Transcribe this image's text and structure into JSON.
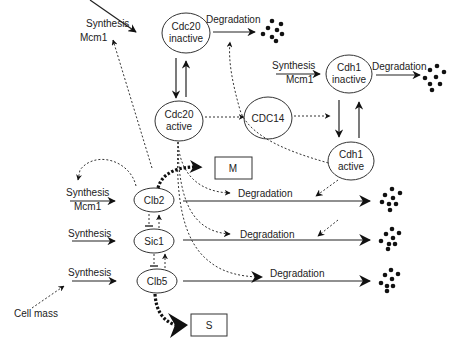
{
  "diagram": {
    "nodes": {
      "cdc20_inactive": {
        "line1": "Cdc20",
        "line2": "inactive"
      },
      "cdc20_active": {
        "line1": "Cdc20",
        "line2": "active"
      },
      "cdc14": {
        "label": "CDC14"
      },
      "cdh1_inactive": {
        "line1": "Cdh1",
        "line2": "inactive"
      },
      "cdh1_active": {
        "line1": "Cdh1",
        "line2": "active"
      },
      "clb2": {
        "label": "Clb2"
      },
      "sic1": {
        "label": "Sic1"
      },
      "clb5": {
        "label": "Clb5"
      },
      "m_phase": {
        "label": "M"
      },
      "s_phase": {
        "label": "S"
      }
    },
    "labels": {
      "synthesis": "Synthesis",
      "degradation": "Degradation",
      "mcm1": "Mcm1",
      "cell_mass": "Cell mass"
    },
    "edges": [
      {
        "from": "Synthesis (Mcm1)",
        "to": "Cdc20 inactive",
        "type": "solid"
      },
      {
        "from": "Cdc20 inactive",
        "to": "Degradation",
        "type": "solid"
      },
      {
        "from": "Cdc20 inactive",
        "to": "Cdc20 active",
        "type": "solid"
      },
      {
        "from": "Cdc20 active",
        "to": "Cdc20 inactive",
        "type": "solid"
      },
      {
        "from": "Cdc20 active",
        "to": "CDC14",
        "type": "dashed"
      },
      {
        "from": "CDC14",
        "to": "Cdh1 inactive→active",
        "type": "dashed"
      },
      {
        "from": "Synthesis (Mcm1)",
        "to": "Cdh1 inactive",
        "type": "solid"
      },
      {
        "from": "Cdh1 inactive",
        "to": "Degradation",
        "type": "solid"
      },
      {
        "from": "Cdh1 inactive",
        "to": "Cdh1 active",
        "type": "solid"
      },
      {
        "from": "Cdh1 active",
        "to": "Cdh1 inactive",
        "type": "solid"
      },
      {
        "from": "Cdh1 active",
        "to": "Cdc20 inactive degradation",
        "type": "dashed"
      },
      {
        "from": "Cdh1 active",
        "to": "Clb2 degradation",
        "type": "dashed"
      },
      {
        "from": "Cdh1 active",
        "to": "Sic1 degradation",
        "type": "dashed"
      },
      {
        "from": "Clb2",
        "to": "Mcm1",
        "type": "dashed"
      },
      {
        "from": "Clb2",
        "to": "Clb2 synthesis",
        "type": "dashed"
      },
      {
        "from": "Clb2",
        "to": "M",
        "type": "bold-dotted"
      },
      {
        "from": "Clb5",
        "to": "S",
        "type": "bold-dotted"
      },
      {
        "from": "Cdc20 active",
        "to": "Clb2 degradation",
        "type": "dashed"
      },
      {
        "from": "Cdc20 active",
        "to": "Sic1 degradation",
        "type": "dashed"
      },
      {
        "from": "Cdc20 active",
        "to": "Clb5 degradation",
        "type": "dashed"
      },
      {
        "from": "Sic1",
        "to": "Clb2",
        "type": "dashed-inhibit"
      },
      {
        "from": "Clb2",
        "to": "Sic1",
        "type": "dashed"
      },
      {
        "from": "Sic1",
        "to": "Clb5",
        "type": "dashed-inhibit"
      },
      {
        "from": "Clb5",
        "to": "Sic1",
        "type": "dashed"
      },
      {
        "from": "Cell mass",
        "to": "Clb5 synthesis",
        "type": "dashed"
      }
    ]
  }
}
